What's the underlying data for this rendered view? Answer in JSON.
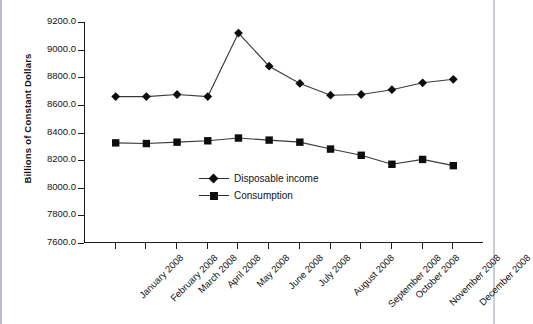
{
  "chart_data": {
    "type": "line",
    "title": "",
    "xlabel": "",
    "ylabel": "Billions of Constant Dollars",
    "ylim": [
      7600.0,
      9200.0
    ],
    "ytick_step": 200.0,
    "yticks": [
      "9200.0",
      "9000.0",
      "8800.0",
      "8600.0",
      "8400.0",
      "8200.0",
      "8000.0",
      "7800.0",
      "7600.0"
    ],
    "ytick_values": [
      9200.0,
      9000.0,
      8800.0,
      8600.0,
      8400.0,
      8200.0,
      8000.0,
      7800.0,
      7600.0
    ],
    "grid": false,
    "legend_position": "center",
    "categories": [
      "January 2008",
      "February 2008",
      "March 2008",
      "April 2008",
      "May 2008",
      "June 2008",
      "July 2008",
      "August 2008",
      "September 2008",
      "October 2008",
      "November 2008",
      "December 2008"
    ],
    "series": [
      {
        "name": "Disposable income",
        "marker": "diamond",
        "color": "#0d0d0d",
        "values": [
          8660,
          8660,
          8675,
          8660,
          9120,
          8880,
          8755,
          8670,
          8675,
          8710,
          8760,
          8785
        ]
      },
      {
        "name": "Consumption",
        "marker": "square",
        "color": "#0d0d0d",
        "values": [
          8325,
          8320,
          8330,
          8340,
          8360,
          8345,
          8330,
          8280,
          8235,
          8170,
          8205,
          8160
        ]
      }
    ]
  },
  "legend": {
    "items": [
      {
        "label": "Disposable income",
        "marker": "diamond"
      },
      {
        "label": "Consumption",
        "marker": "square"
      }
    ]
  }
}
